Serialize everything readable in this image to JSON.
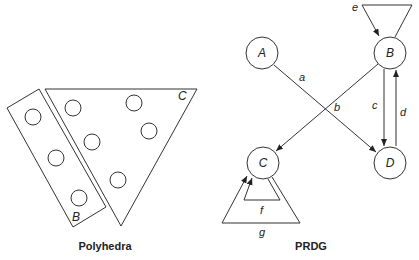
{
  "polyhedra": {
    "caption": "Polyhedra",
    "label_b": "B",
    "label_c": "C"
  },
  "prdg": {
    "caption": "PRDG",
    "nodes": {
      "a": "A",
      "b": "B",
      "c": "C",
      "d": "D"
    },
    "edges": {
      "a": "a",
      "b": "b",
      "c": "c",
      "d": "d",
      "e": "e",
      "f": "f",
      "g": "g"
    }
  }
}
